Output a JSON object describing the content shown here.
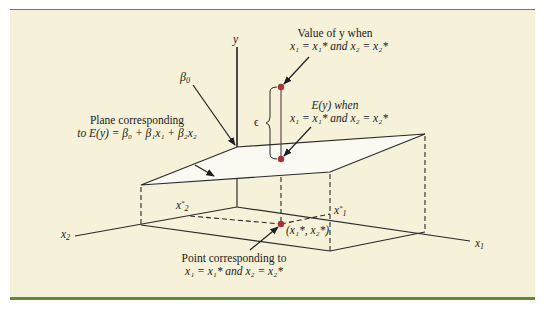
{
  "figure": {
    "colors": {
      "background": "#f6f1d9",
      "rule": "#5e8a3a",
      "plane_fill": "#faf9f2",
      "lines": "#2a2a2a",
      "points": "#a8323a"
    }
  },
  "axes": {
    "y_label": "y",
    "x1_label": "x",
    "x1_sub": "1",
    "x2_label": "x",
    "x2_sub": "2"
  },
  "ticks": {
    "x1_star": "x",
    "x1_star_sub": "1",
    "x2_star": "x",
    "x2_star_sub": "2",
    "star": "*"
  },
  "annotations": {
    "beta0": {
      "symbol": "β",
      "sub": "0"
    },
    "epsilon": "ϵ",
    "value_of_y": {
      "line1": "Value of y when",
      "line2": "x₁ = x₁* and x₂ = x₂*"
    },
    "ey_when": {
      "line1": "E(y) when",
      "line2": "x₁ = x₁* and x₂ = x₂*"
    },
    "plane": {
      "line1": "Plane corresponding",
      "line2": "to E(y) = β₀ + β₁x₁ + β₂x₂"
    },
    "point_label": "(x₁*, x₂*)",
    "point_corresponding": {
      "line1": "Point corresponding to",
      "line2": "x₁ = x₁* and x₂ = x₂*"
    }
  }
}
